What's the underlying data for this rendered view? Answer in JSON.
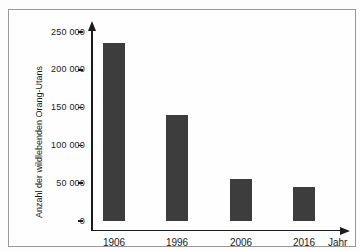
{
  "colors": {
    "bar": "#3d3d3d",
    "axis": "#1c1c1c",
    "frame_border": "#9a9a9a",
    "background": "#fdfdfd",
    "text": "#1a1a1a"
  },
  "chart_data": {
    "type": "bar",
    "categories": [
      "1906",
      "1996",
      "2006",
      "2016"
    ],
    "values": [
      235000,
      140000,
      55000,
      45000
    ],
    "title": "",
    "xlabel": "Jahr",
    "ylabel": "Anzahl der wildlebenden Orang-Utans",
    "ylim": [
      0,
      250000
    ],
    "ytick_step": 50000,
    "y_tick_labels": [
      "0",
      "50 000",
      "100 000",
      "150 000",
      "200 000",
      "250 000"
    ],
    "grid": false,
    "legend": null,
    "bar_color": "#3d3d3d"
  },
  "layout_hints": {
    "axis_arrows": "up and right arrowheads on axes",
    "bars_count": 4
  }
}
